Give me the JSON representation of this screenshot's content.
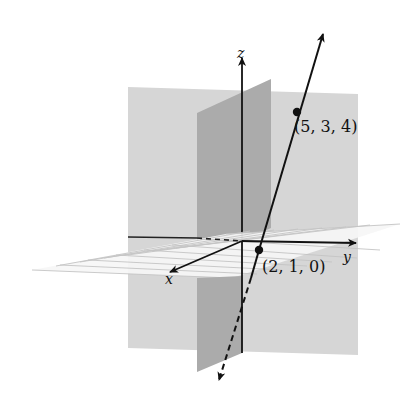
{
  "figure": {
    "axes": {
      "x_label": "x",
      "y_label": "y",
      "z_label": "z"
    },
    "points": [
      {
        "label": "(5, 3, 4)",
        "coords": [
          5,
          3,
          4
        ]
      },
      {
        "label": "(2, 1, 0)",
        "coords": [
          2,
          1,
          0
        ]
      }
    ],
    "planes": [
      "yz-plane",
      "xz-plane",
      "xy-plane"
    ],
    "colors": {
      "yz_plane": "#d6d6d6",
      "xz_plane": "#a9a9a9",
      "xy_plane": "#f4f4f4",
      "grid": "#c2c2c2",
      "line": "#111111"
    }
  }
}
